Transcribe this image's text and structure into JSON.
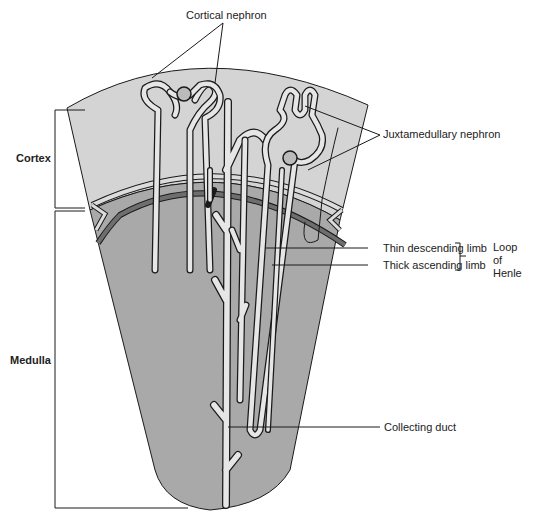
{
  "diagram": {
    "colors": {
      "cortex": "#d4d4d4",
      "medulla": "#a9a9a9",
      "tubule_fill": "#e6e6e6",
      "outline": "#1a1a1a",
      "vessel_dark": "#6e6e6e"
    },
    "labels": {
      "cortical_nephron": "Cortical nephron",
      "juxtamedullary_nephron": "Juxtamedullary nephron",
      "cortex": "Cortex",
      "medulla": "Medulla",
      "thin_descending_limb": "Thin descending limb",
      "thick_ascending_limb": "Thick ascending limb",
      "loop_of_henle_line1": "Loop",
      "loop_of_henle_line2": "of",
      "loop_of_henle_line3": "Henle",
      "collecting_duct": "Collecting duct"
    }
  }
}
